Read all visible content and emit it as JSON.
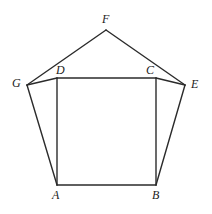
{
  "figure": {
    "background_color": "#ffffff",
    "stroke_color": "#2b2b2b",
    "stroke_width": 1.4,
    "width": 212,
    "height": 214
  },
  "points": {
    "A": {
      "label": "A",
      "x": 57,
      "y": 185
    },
    "B": {
      "label": "B",
      "x": 156,
      "y": 185
    },
    "C": {
      "label": "C",
      "x": 156,
      "y": 78
    },
    "D": {
      "label": "D",
      "x": 57,
      "y": 78
    },
    "E": {
      "label": "E",
      "x": 185,
      "y": 85
    },
    "F": {
      "label": "F",
      "x": 106,
      "y": 30
    },
    "G": {
      "label": "G",
      "x": 27,
      "y": 85
    }
  },
  "labels": [
    {
      "name": "label-F",
      "text": "F",
      "x": 102,
      "y": 13
    },
    {
      "name": "label-G",
      "text": "G",
      "x": 12,
      "y": 77
    },
    {
      "name": "label-D",
      "text": "D",
      "x": 56,
      "y": 64
    },
    {
      "name": "label-C",
      "text": "C",
      "x": 146,
      "y": 64
    },
    {
      "name": "label-E",
      "text": "E",
      "x": 191,
      "y": 78
    },
    {
      "name": "label-A",
      "text": "A",
      "x": 52,
      "y": 189
    },
    {
      "name": "label-B",
      "text": "B",
      "x": 152,
      "y": 189
    }
  ],
  "segments": [
    {
      "name": "segment-G-F",
      "from": "G",
      "to": "F"
    },
    {
      "name": "segment-F-E",
      "from": "F",
      "to": "E"
    },
    {
      "name": "segment-E-B",
      "from": "E",
      "to": "B"
    },
    {
      "name": "segment-B-A",
      "from": "B",
      "to": "A"
    },
    {
      "name": "segment-A-G",
      "from": "A",
      "to": "G"
    },
    {
      "name": "segment-A-D",
      "from": "A",
      "to": "D"
    },
    {
      "name": "segment-D-C",
      "from": "D",
      "to": "C"
    },
    {
      "name": "segment-C-B",
      "from": "C",
      "to": "B"
    },
    {
      "name": "segment-G-D",
      "from": "G",
      "to": "D"
    },
    {
      "name": "segment-C-E",
      "from": "C",
      "to": "E"
    }
  ]
}
